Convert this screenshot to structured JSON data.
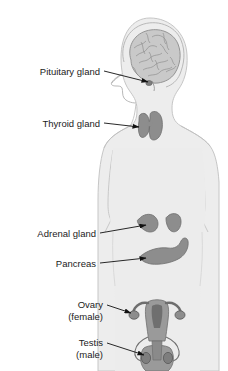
{
  "figure": {
    "type": "anatomical-diagram",
    "background_color": "#ffffff",
    "body_fill": "#ededed",
    "body_outline": "#c2c2c2",
    "organ_fill": "#8d8d8d",
    "organ_outline": "#6e6e6e",
    "brain_fill": "#c9c9c9",
    "brain_outline": "#8f8f8f",
    "leader_color": "#111111",
    "text_color": "#1b1b1b"
  },
  "labels": [
    {
      "id": "pituitary",
      "text": "Pituitary gland",
      "sub": "",
      "text_x": 100,
      "text_y": 75,
      "leader": "M104,71 L148,82",
      "arrow": true
    },
    {
      "id": "thyroid",
      "text": "Thyroid gland",
      "sub": "",
      "text_x": 100,
      "text_y": 126,
      "leader": "M104,123 L140,128",
      "arrow": true
    },
    {
      "id": "adrenal",
      "text": "Adrenal gland",
      "sub": "",
      "text_x": 96,
      "text_y": 236,
      "leader": "M100,233 L141,226",
      "arrow": true
    },
    {
      "id": "pancreas",
      "text": "Pancreas",
      "sub": "",
      "text_x": 96,
      "text_y": 266,
      "leader": "M100,263 L142,259",
      "arrow": true
    },
    {
      "id": "ovary",
      "text": "Ovary",
      "sub": "(female)",
      "text_x": 103,
      "text_y": 306,
      "sub_x": 103,
      "sub_y": 318,
      "leader": "M107,307 L132,313",
      "arrow": true
    },
    {
      "id": "testis",
      "text": "Testis",
      "sub": "(male)",
      "text_x": 103,
      "text_y": 344,
      "sub_x": 103,
      "sub_y": 356,
      "leader": "M107,345 L136,352",
      "arrow": true
    }
  ],
  "organs": [
    {
      "id": "brain",
      "name": "Brain",
      "region": "head"
    },
    {
      "id": "pituitary-gland",
      "name": "Pituitary gland",
      "region": "head"
    },
    {
      "id": "thyroid-gland",
      "name": "Thyroid gland",
      "region": "neck"
    },
    {
      "id": "adrenal-gland-left",
      "name": "Adrenal gland (left)",
      "region": "abdomen"
    },
    {
      "id": "adrenal-gland-right",
      "name": "Adrenal gland (right)",
      "region": "abdomen"
    },
    {
      "id": "pancreas",
      "name": "Pancreas",
      "region": "abdomen"
    },
    {
      "id": "uterus-ovaries",
      "name": "Uterus and ovaries",
      "region": "pelvis"
    },
    {
      "id": "testes",
      "name": "Testes",
      "region": "pelvis"
    }
  ]
}
